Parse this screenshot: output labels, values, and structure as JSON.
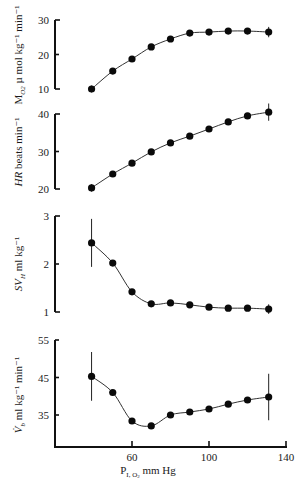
{
  "figure": {
    "xlabel_main": "P",
    "xlabel_sub": "I, O",
    "xlabel_sub2": "2",
    "xlabel_unit": " mm Hg"
  },
  "chart_data": [
    {
      "type": "line",
      "panel": "top",
      "title": "",
      "ylabel": "M_O2 µmol kg⁻¹ min⁻¹",
      "ylabel_parts": {
        "main": "M",
        "sub": "O2",
        "rest": " µ mol kg⁻¹ min⁻¹"
      },
      "xlabel": "P I,O2 mm Hg",
      "y_ticks": [
        10,
        20,
        30
      ],
      "ylim": [
        10,
        30
      ],
      "x": [
        39,
        50,
        60,
        70,
        80,
        90,
        100,
        110,
        120,
        131
      ],
      "values": [
        10.0,
        15.2,
        18.7,
        22.2,
        24.5,
        26.2,
        26.5,
        26.8,
        26.8,
        26.5
      ],
      "error_bars": {
        "first": 1.0,
        "last": 1.5
      },
      "marker": "filled-circle",
      "fit_line": true
    },
    {
      "type": "line",
      "panel": "heart-rate",
      "title": "",
      "ylabel": "HR beats min⁻¹",
      "ylabel_parts": {
        "main": "HR",
        "sub": "",
        "rest": " beats min⁻¹"
      },
      "y_ticks": [
        20,
        30,
        40
      ],
      "ylim": [
        20,
        40
      ],
      "x": [
        39,
        50,
        60,
        70,
        80,
        90,
        100,
        110,
        120,
        131
      ],
      "values": [
        20.3,
        24.0,
        26.9,
        29.9,
        32.3,
        34.1,
        36.0,
        37.9,
        39.5,
        40.5
      ],
      "error_bars": {
        "first": 1.0,
        "last": 2.3
      },
      "marker": "filled-circle",
      "fit_line": true
    },
    {
      "type": "line",
      "panel": "stroke-volume",
      "title": "",
      "ylabel": "SV_H ml kg⁻¹",
      "ylabel_parts": {
        "main": "SV",
        "sub": "H",
        "rest": " ml kg⁻¹"
      },
      "y_ticks": [
        1,
        2,
        3
      ],
      "ylim": [
        1,
        3
      ],
      "x": [
        39,
        50,
        60,
        70,
        80,
        90,
        100,
        110,
        120,
        131
      ],
      "values": [
        2.44,
        2.02,
        1.42,
        1.17,
        1.19,
        1.15,
        1.1,
        1.08,
        1.08,
        1.06
      ],
      "error_bars": {
        "first": 0.5,
        "last": 0.1
      },
      "marker": "filled-circle",
      "fit_line": true
    },
    {
      "type": "line",
      "panel": "cardiac-output",
      "title": "",
      "ylabel": "V̇_b ml kg⁻¹ min⁻¹",
      "ylabel_parts": {
        "main": "V̇",
        "sub": "b",
        "rest": " ml kg⁻¹ min⁻¹"
      },
      "xlabel": "P I,O2 mm Hg",
      "x_ticks": [
        60,
        100,
        140
      ],
      "xlim": [
        30,
        140
      ],
      "y_ticks": [
        35,
        45,
        55
      ],
      "ylim": [
        27,
        55
      ],
      "x": [
        39,
        50,
        60,
        70,
        80,
        90,
        100,
        110,
        120,
        131
      ],
      "values": [
        45.3,
        41.0,
        33.4,
        32.1,
        35.0,
        35.8,
        36.6,
        37.9,
        39.0,
        39.8
      ],
      "error_bars": {
        "first": 6.5,
        "last": 6.2
      },
      "marker": "filled-circle",
      "fit_line": true
    }
  ]
}
